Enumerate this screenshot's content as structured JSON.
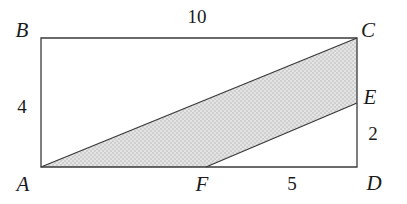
{
  "figure": {
    "type": "geometry-diagram",
    "background_color": "#ffffff",
    "stroke_color": "#3a3a3a",
    "shade_color": "#d9d9d9",
    "shade_pattern": "stipple",
    "vertices": [
      {
        "id": "B",
        "label": "B",
        "x": 41,
        "y": 38,
        "role": "rectangle-corner-top-left"
      },
      {
        "id": "C",
        "label": "C",
        "x": 357,
        "y": 38,
        "role": "rectangle-corner-top-right"
      },
      {
        "id": "E",
        "label": "E",
        "x": 357,
        "y": 103,
        "role": "point-on-side-CD"
      },
      {
        "id": "D",
        "label": "D",
        "x": 357,
        "y": 167,
        "role": "rectangle-corner-bottom-right"
      },
      {
        "id": "F",
        "label": "F",
        "x": 206,
        "y": 167,
        "role": "point-on-side-AD"
      },
      {
        "id": "A",
        "label": "A",
        "x": 41,
        "y": 167,
        "role": "rectangle-corner-bottom-left"
      }
    ],
    "rectangle_path": "41,38 357,38 357,167 41,167",
    "shaded_polygon_path": "41,167 357,38 357,103 206,167",
    "segments": [
      {
        "id": "AC",
        "from": "A",
        "to": "C",
        "kind": "diagonal"
      },
      {
        "id": "FE",
        "from": "F",
        "to": "E",
        "kind": "chord"
      }
    ],
    "measures": [
      {
        "id": "top",
        "value": "10",
        "side": "BC",
        "position": "above"
      },
      {
        "id": "left",
        "value": "4",
        "side": "AB",
        "position": "left"
      },
      {
        "id": "right",
        "value": "2",
        "side": "ED",
        "position": "right"
      },
      {
        "id": "bottom",
        "value": "5",
        "side": "FD",
        "position": "below"
      }
    ]
  }
}
